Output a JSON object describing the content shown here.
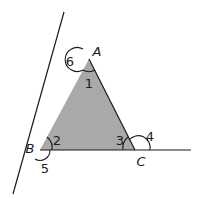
{
  "figure": {
    "type": "triangle-exterior-angles",
    "fill_color": "#a9a9a9",
    "line_color": "#1a1a1a",
    "vertices": {
      "A": {
        "label": "A",
        "x": 89,
        "y": 59
      },
      "B": {
        "label": "B",
        "x": 40,
        "y": 150
      },
      "C": {
        "label": "C",
        "x": 135,
        "y": 150
      }
    },
    "extended_lines": [
      {
        "name": "line-through-B-A",
        "from": [
          13,
          194
        ],
        "to": [
          64,
          12
        ]
      },
      {
        "name": "line-through-B-C",
        "from": [
          40,
          150
        ],
        "to": [
          191,
          150
        ]
      }
    ],
    "angle_labels": [
      {
        "label": "1",
        "x": 89,
        "y": 83,
        "note": "interior angle at A"
      },
      {
        "label": "2",
        "x": 57,
        "y": 140,
        "note": "interior angle at B"
      },
      {
        "label": "3",
        "x": 120,
        "y": 140,
        "note": "interior angle at C"
      },
      {
        "label": "4",
        "x": 150,
        "y": 136,
        "note": "exterior angle at C"
      },
      {
        "label": "5",
        "x": 45,
        "y": 168,
        "note": "exterior angle at B"
      },
      {
        "label": "6",
        "x": 70,
        "y": 61,
        "note": "exterior angle at A"
      }
    ],
    "vertex_label_positions": {
      "A": {
        "x": 97,
        "y": 51
      },
      "B": {
        "x": 30,
        "y": 148
      },
      "C": {
        "x": 141,
        "y": 161
      }
    }
  }
}
